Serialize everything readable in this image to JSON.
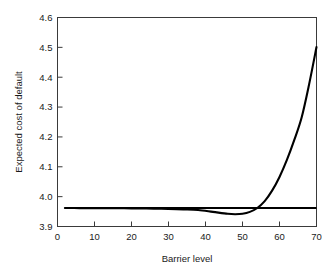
{
  "chart_data": {
    "type": "line",
    "title": "",
    "xlabel": "Barrier level",
    "ylabel": "Expected cost of default",
    "xlim": [
      0,
      70
    ],
    "ylim": [
      3.9,
      4.6
    ],
    "xticks": [
      0,
      10,
      20,
      30,
      40,
      50,
      60,
      70
    ],
    "xtick_labels": [
      "0",
      "10",
      "20",
      "30",
      "40",
      "50",
      "60",
      "70"
    ],
    "yticks": [
      3.9,
      4.0,
      4.1,
      4.2,
      4.3,
      4.4,
      4.5,
      4.6
    ],
    "ytick_labels": [
      "3.9",
      "4.0",
      "4.1",
      "4.2",
      "4.3",
      "4.4",
      "4.5",
      "4.6"
    ],
    "grid": false,
    "legend": false,
    "frame": "box",
    "line_color": "#000000",
    "series": [
      {
        "name": "Benchmark cost",
        "kind": "horizontal-reference-line",
        "value": 3.962,
        "x": [
          2,
          70
        ],
        "values": [
          3.962,
          3.962
        ]
      },
      {
        "name": "Expected cost of default",
        "kind": "curve",
        "x": [
          2,
          6,
          10,
          14,
          18,
          22,
          26,
          30,
          34,
          38,
          42,
          46,
          48,
          50,
          52,
          54,
          56,
          58,
          60,
          62,
          64,
          66,
          68,
          70
        ],
        "values": [
          3.9618,
          3.9617,
          3.9615,
          3.9613,
          3.961,
          3.9606,
          3.96,
          3.959,
          3.9575,
          3.9553,
          3.949,
          3.9425,
          3.9412,
          3.9425,
          3.949,
          3.962,
          3.985,
          4.02,
          4.066,
          4.123,
          4.19,
          4.266,
          4.376,
          4.501
        ]
      }
    ],
    "annotations": {
      "minimum_point": {
        "x": 48,
        "y": 3.941
      },
      "crossover_point": {
        "x": 53,
        "y": 3.962
      },
      "endpoint": {
        "x": 70,
        "y": 4.501
      }
    }
  }
}
